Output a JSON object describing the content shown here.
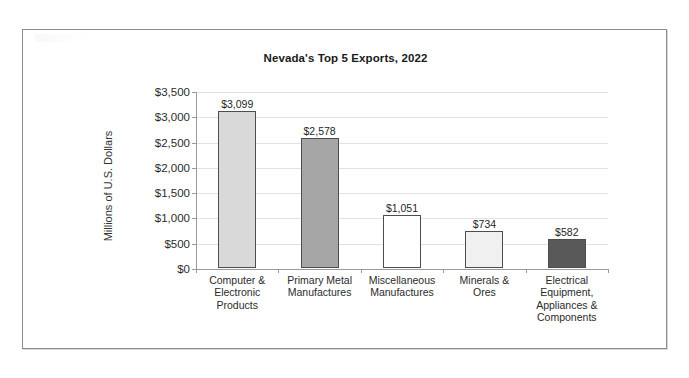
{
  "chart_data": {
    "type": "bar",
    "title": "Nevada's Top 5 Exports, 2022",
    "xlabel": "",
    "ylabel": "Millions of U.S. Dollars",
    "ylim": [
      0,
      3500
    ],
    "ytick_step": 500,
    "grid": true,
    "legend": "none",
    "categories": [
      "Computer & Electronic Products",
      "Primary Metal Manufactures",
      "Miscellaneous Manufactures",
      "Minerals & Ores",
      "Electrical Equipment, Appliances & Components"
    ],
    "category_lines": [
      [
        "Computer &",
        "Electronic",
        "Products"
      ],
      [
        "Primary Metal",
        "Manufactures"
      ],
      [
        "Miscellaneous",
        "Manufactures"
      ],
      [
        "Minerals &",
        "Ores"
      ],
      [
        "Electrical",
        "Equipment,",
        "Appliances &",
        "Components"
      ]
    ],
    "values": [
      3099,
      2578,
      1051,
      734,
      582
    ],
    "value_labels": [
      "$3,099",
      "$2,578",
      "$1,051",
      "$734",
      "$582"
    ],
    "bar_colors": [
      "#d9d9d9",
      "#a6a6a6",
      "#ffffff",
      "#f0f0f0",
      "#595959"
    ],
    "bar_border_color": "#4d4d4d",
    "ytick_labels": [
      "$3,500",
      "$3,000",
      "$2,500",
      "$2,000",
      "$1,500",
      "$1,000",
      "$500",
      "$0"
    ],
    "ytick_values": [
      3500,
      3000,
      2500,
      2000,
      1500,
      1000,
      500,
      0
    ]
  },
  "frame": {
    "border_color": "#8c8c8c",
    "background": "#ffffff"
  }
}
